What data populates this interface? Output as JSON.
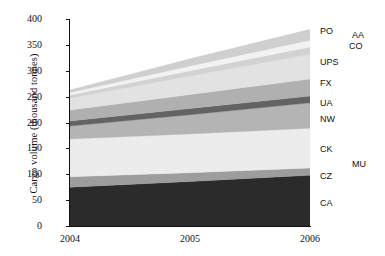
{
  "chart_data": {
    "type": "area",
    "title": "",
    "subtitle": "",
    "xlabel": "",
    "ylabel": "Cargo volume (thousand tonnes)",
    "x": [
      2004,
      2005,
      2006
    ],
    "xtick_labels": [
      "2004",
      "2005",
      "2006"
    ],
    "ytick_labels": [
      "0",
      "50",
      "100",
      "150",
      "200",
      "250",
      "300",
      "350",
      "400"
    ],
    "yticks": [
      0,
      50,
      100,
      150,
      200,
      250,
      300,
      350,
      400
    ],
    "ylim": [
      0,
      400
    ],
    "xlim": [
      2004,
      2006
    ],
    "grid": false,
    "stacked": true,
    "legend_position": "right-outside",
    "series": [
      {
        "name": "CA",
        "label": "CA",
        "color": "#2b2b2b",
        "values": [
          75,
          86,
          98
        ]
      },
      {
        "name": "CZ",
        "label": "CZ",
        "color": "#9d9d9d",
        "values": [
          20,
          17,
          14
        ]
      },
      {
        "name": "CK",
        "label": "CK",
        "color": "#ececec",
        "values": [
          73,
          75,
          77
        ]
      },
      {
        "name": "NW",
        "label": "NW",
        "color": "#b4b4b4",
        "values": [
          25,
          37,
          49
        ]
      },
      {
        "name": "UA",
        "label": "UA",
        "color": "#636363",
        "values": [
          10,
          12,
          13
        ]
      },
      {
        "name": "FX",
        "label": "FX",
        "color": "#b0b0b0",
        "values": [
          21,
          27,
          33
        ]
      },
      {
        "name": "UPS",
        "label": "UPS",
        "color": "#e2e2e2",
        "values": [
          23,
          36,
          48
        ]
      },
      {
        "name": "CO",
        "label": "CO",
        "color": "#d2d2d2",
        "values": [
          6,
          10,
          14
        ]
      },
      {
        "name": "AA",
        "label": "AA",
        "color": "#f2f2f2",
        "values": [
          5,
          9,
          13
        ]
      },
      {
        "name": "PO",
        "label": "PO",
        "color": "#cfcfcf",
        "values": [
          5,
          14,
          21
        ]
      },
      {
        "name": "MU",
        "label": "MU",
        "color": "#ffffff",
        "values": [
          0,
          0,
          0
        ]
      }
    ],
    "axis_color": "#111111",
    "plot_background": "#ffffff"
  },
  "series_labels": [
    {
      "text": "PO",
      "x": 320,
      "y": 27
    },
    {
      "text": "AA",
      "x": 352,
      "y": 31
    },
    {
      "text": "CO",
      "x": 349,
      "y": 42
    },
    {
      "text": "UPS",
      "x": 320,
      "y": 58
    },
    {
      "text": "FX",
      "x": 320,
      "y": 79
    },
    {
      "text": "UA",
      "x": 320,
      "y": 99
    },
    {
      "text": "NW",
      "x": 320,
      "y": 115
    },
    {
      "text": "CK",
      "x": 320,
      "y": 145
    },
    {
      "text": "MU",
      "x": 352,
      "y": 160
    },
    {
      "text": "CZ",
      "x": 320,
      "y": 172
    },
    {
      "text": "CA",
      "x": 320,
      "y": 199
    }
  ]
}
